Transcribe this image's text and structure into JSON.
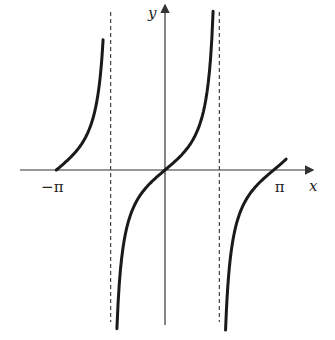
{
  "chart_data": {
    "type": "line",
    "title": "",
    "function": "y = tan(x)",
    "xlabel": "x",
    "ylabel": "y",
    "xlim": [
      -3.2,
      4.4
    ],
    "ylim": [
      -5.4,
      5.6
    ],
    "x_tick_labels": [
      {
        "value": -3.14159,
        "label": "−π"
      },
      {
        "value": 3.14159,
        "label": "π"
      }
    ],
    "asymptotes": [
      -1.5708,
      1.5708
    ],
    "branches": [
      {
        "name": "left-branch",
        "x_range": [
          -3.14159,
          -1.79
        ]
      },
      {
        "name": "middle-branch",
        "x_range": [
          -1.39,
          1.39
        ]
      },
      {
        "name": "right-branch",
        "x_range": [
          1.75,
          3.5
        ]
      }
    ],
    "grid": false,
    "legend": "none",
    "colors": {
      "curve": "#1a1a1a",
      "axis": "#333333",
      "asymptote": "#444444"
    }
  }
}
